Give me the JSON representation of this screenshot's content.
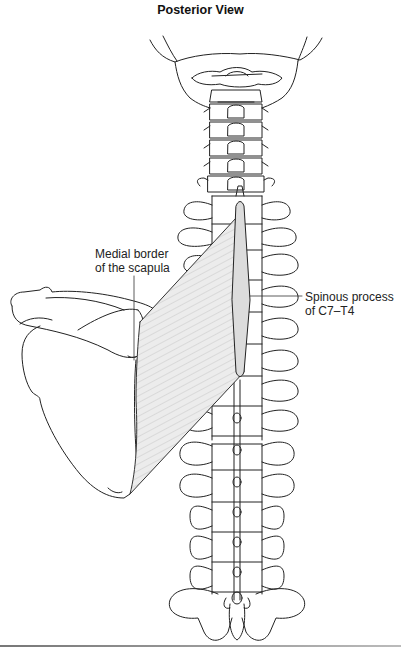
{
  "figure": {
    "title": "Posterior View",
    "labels": {
      "medial_border": [
        "Medial border",
        "of the scapula"
      ],
      "spinous_process": [
        "Spinous process",
        "of C7–T4"
      ]
    },
    "structures": [
      "skull-base",
      "cervical-vertebrae",
      "thoracic-vertebrae",
      "lumbar-vertebrae",
      "sacrum",
      "scapula",
      "rhomboid-muscle",
      "spinous-process-attachment"
    ],
    "colors": {
      "line": "#222222",
      "muscle_fill": "#e6e6e6",
      "muscle_hatch": "#b8b8b8",
      "attachment_fill": "#d8d8d8"
    }
  }
}
